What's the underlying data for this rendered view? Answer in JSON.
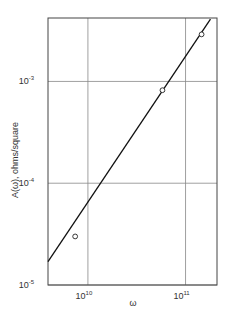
{
  "chart_data": {
    "type": "line",
    "title": "",
    "xlabel": "ω",
    "ylabel": "A(ω), ohms/square",
    "xscale": "log",
    "yscale": "log",
    "xlim": [
      3900000000.0,
      210000000000.0
    ],
    "ylim": [
      1e-05,
      0.0042
    ],
    "grid": true,
    "x_ticks": [
      {
        "value": 10000000000.0,
        "base": "10",
        "exp": "10"
      },
      {
        "value": 100000000000.0,
        "base": "10",
        "exp": "11"
      }
    ],
    "y_ticks": [
      {
        "value": 1e-05,
        "base": "10",
        "exp": "-5"
      },
      {
        "value": 0.0001,
        "base": "10",
        "exp": "-4"
      },
      {
        "value": 0.001,
        "base": "10",
        "exp": "-3"
      }
    ],
    "series": [
      {
        "name": "measured",
        "style": "open-circle markers",
        "x": [
          7400000000.0,
          58000000000.0,
          146000000000.0
        ],
        "y": [
          3e-05,
          0.00082,
          0.0029
        ]
      },
      {
        "name": "fit",
        "style": "solid line",
        "x": [
          3900000000.0,
          180000000000.0
        ],
        "y": [
          1.7e-05,
          0.0041
        ]
      }
    ],
    "legend": null
  },
  "labels": {
    "y_axis_title": "A(ω), ohms/square",
    "x_axis_title": "ω"
  }
}
